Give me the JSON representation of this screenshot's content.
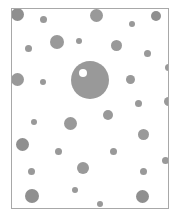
{
  "figure": {
    "kind": "micrograph-particle-field",
    "title": "",
    "caption": "",
    "canvas": {
      "width": 181,
      "height": 221
    },
    "background_color": "#ffffff",
    "frame": {
      "x": 11,
      "y": 8,
      "width": 158,
      "height": 201,
      "border_color": "#a8a8a8",
      "border_width": 1,
      "fill_color": "#ffffff"
    },
    "particle_color": "#999999",
    "particle_color_dark": "#8f8f8f",
    "vacuole_color": "#ffffff",
    "particle_count": 41
  },
  "chart_data": {
    "type": "scatter",
    "title": "",
    "xlabel": "",
    "ylabel": "",
    "grid": false,
    "legend": null,
    "xlim": [
      11,
      169
    ],
    "ylim": [
      8,
      209
    ],
    "units": "pixels",
    "marker": "filled-circle",
    "series": [
      {
        "name": "particles",
        "color": "#999999",
        "points": [
          {
            "x": 17,
            "y": 14,
            "r": 6.5,
            "tone": "dark"
          },
          {
            "x": 43,
            "y": 19,
            "r": 3.5,
            "tone": "normal"
          },
          {
            "x": 96,
            "y": 15,
            "r": 6.5,
            "tone": "normal"
          },
          {
            "x": 132,
            "y": 24,
            "r": 3.0,
            "tone": "normal"
          },
          {
            "x": 156,
            "y": 16,
            "r": 5.0,
            "tone": "dark"
          },
          {
            "x": 57,
            "y": 42,
            "r": 7.0,
            "tone": "normal"
          },
          {
            "x": 79,
            "y": 41,
            "r": 3.0,
            "tone": "normal"
          },
          {
            "x": 116,
            "y": 45,
            "r": 5.5,
            "tone": "normal"
          },
          {
            "x": 28,
            "y": 48,
            "r": 3.5,
            "tone": "normal"
          },
          {
            "x": 147,
            "y": 53,
            "r": 3.5,
            "tone": "normal"
          },
          {
            "x": 90,
            "y": 80,
            "r": 19.0,
            "tone": "normal"
          },
          {
            "x": 168,
            "y": 67,
            "r": 3.5,
            "tone": "normal"
          },
          {
            "x": 17,
            "y": 79,
            "r": 6.5,
            "tone": "normal"
          },
          {
            "x": 43,
            "y": 82,
            "r": 3.0,
            "tone": "normal"
          },
          {
            "x": 130,
            "y": 79,
            "r": 4.5,
            "tone": "normal"
          },
          {
            "x": 168,
            "y": 101,
            "r": 4.5,
            "tone": "normal"
          },
          {
            "x": 138,
            "y": 103,
            "r": 3.5,
            "tone": "normal"
          },
          {
            "x": 34,
            "y": 122,
            "r": 3.0,
            "tone": "normal"
          },
          {
            "x": 70,
            "y": 123,
            "r": 6.5,
            "tone": "normal"
          },
          {
            "x": 108,
            "y": 115,
            "r": 5.0,
            "tone": "normal"
          },
          {
            "x": 22,
            "y": 144,
            "r": 6.5,
            "tone": "dark"
          },
          {
            "x": 58,
            "y": 151,
            "r": 3.5,
            "tone": "normal"
          },
          {
            "x": 143,
            "y": 134,
            "r": 5.5,
            "tone": "normal"
          },
          {
            "x": 113,
            "y": 151,
            "r": 3.5,
            "tone": "normal"
          },
          {
            "x": 31,
            "y": 171,
            "r": 3.5,
            "tone": "normal"
          },
          {
            "x": 83,
            "y": 168,
            "r": 6.0,
            "tone": "normal"
          },
          {
            "x": 165,
            "y": 160,
            "r": 3.5,
            "tone": "normal"
          },
          {
            "x": 143,
            "y": 171,
            "r": 3.5,
            "tone": "normal"
          },
          {
            "x": 75,
            "y": 190,
            "r": 3.0,
            "tone": "normal"
          },
          {
            "x": 32,
            "y": 196,
            "r": 7.0,
            "tone": "dark"
          },
          {
            "x": 100,
            "y": 204,
            "r": 3.0,
            "tone": "normal"
          },
          {
            "x": 142,
            "y": 196,
            "r": 6.5,
            "tone": "dark"
          }
        ]
      }
    ],
    "annotations": [
      {
        "name": "vacuole",
        "description": "white inclusion inside largest particle",
        "x": 83,
        "y": 73,
        "r": 4.0,
        "color": "#ffffff"
      }
    ]
  }
}
